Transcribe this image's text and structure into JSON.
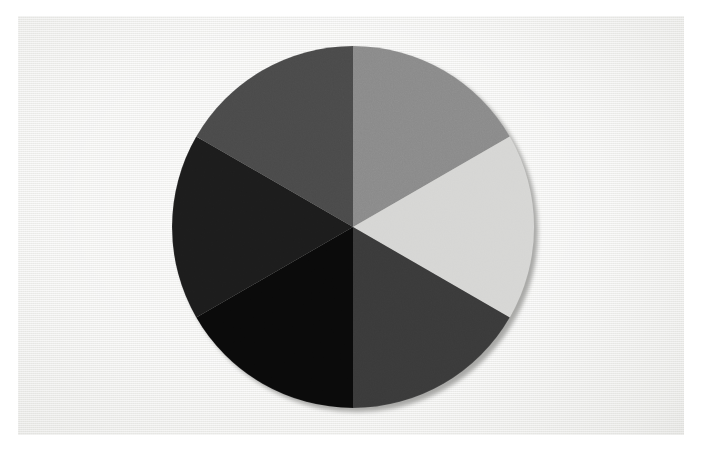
{
  "image": {
    "title": "Grayscale Six-Segment Colour Wheel",
    "subject": "circular disc divided into six equal grayscale sectors",
    "frame_color": "#ffffff",
    "background_color": "#f1f1ef",
    "width_px": 702,
    "height_px": 451
  },
  "disc": {
    "center_x": 335,
    "center_y": 211,
    "radius": 181,
    "shadow_color": "#a8a8a6",
    "shadow_offset_x": 4,
    "shadow_offset_y": 4,
    "segment_count": 6,
    "segment_angle_degrees": 60,
    "start_angle_degrees": -90
  },
  "chart_data": {
    "type": "pie",
    "xlabel": "",
    "ylabel": "",
    "legend_position": "none",
    "grid": false,
    "categories": [
      "Segment 1",
      "Segment 2",
      "Segment 3",
      "Segment 4",
      "Segment 5",
      "Segment 6"
    ],
    "values": [
      16.667,
      16.667,
      16.667,
      16.667,
      16.667,
      16.667
    ],
    "colors": [
      "#8a8a8a",
      "#d6d6d4",
      "#3a3a3a",
      "#0a0a0a",
      "#1c1c1c",
      "#4a4a4a"
    ],
    "annotations": [
      "All six wedges span an identical 60 degrees",
      "Sector boundaries meet at the disc centre",
      "First boundary points straight up (12 o'clock)"
    ]
  },
  "segments": [
    {
      "name": "segment-top-right",
      "position_label": "top right",
      "clock_position": "12 to 2 o'clock",
      "start_angle": -90,
      "end_angle": -30,
      "color": "#8a8a8a",
      "tone": "mid gray"
    },
    {
      "name": "segment-right",
      "position_label": "right",
      "clock_position": "2 to 4 o'clock",
      "start_angle": -30,
      "end_angle": 30,
      "color": "#d6d6d4",
      "tone": "light gray"
    },
    {
      "name": "segment-bottom-right",
      "position_label": "bottom right",
      "clock_position": "4 to 6 o'clock",
      "start_angle": 30,
      "end_angle": 90,
      "color": "#3a3a3a",
      "tone": "dark gray"
    },
    {
      "name": "segment-bottom-left",
      "position_label": "bottom left",
      "clock_position": "6 to 8 o'clock",
      "start_angle": 90,
      "end_angle": 150,
      "color": "#0a0a0a",
      "tone": "near black"
    },
    {
      "name": "segment-left",
      "position_label": "left",
      "clock_position": "8 to 10 o'clock",
      "start_angle": 150,
      "end_angle": 210,
      "color": "#1c1c1c",
      "tone": "very dark gray"
    },
    {
      "name": "segment-top-left",
      "position_label": "top left",
      "clock_position": "10 to 12 o'clock",
      "start_angle": 210,
      "end_angle": 270,
      "color": "#4a4a4a",
      "tone": "charcoal gray"
    }
  ]
}
